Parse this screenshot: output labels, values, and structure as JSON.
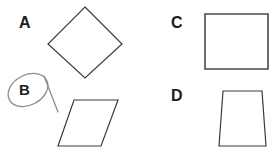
{
  "worksheet": {
    "background_color": "#ffffff",
    "stroke_color": "#3a3a3a",
    "annotation_color": "#8c8c8c",
    "label_color": "#1b1b1b",
    "width": 274,
    "height": 159
  },
  "options": [
    {
      "id": "a",
      "label": "A",
      "shape_name": "rhombus-diamond",
      "selected": false,
      "points": "85,7 122,44 85,78 48,44"
    },
    {
      "id": "b",
      "label": "B",
      "shape_name": "parallelogram",
      "selected": true,
      "points": "74,100 118,100 101,146 58,146"
    },
    {
      "id": "c",
      "label": "C",
      "shape_name": "rectangle",
      "selected": false,
      "points": "205,14 268,14 268,69 205,69"
    },
    {
      "id": "d",
      "label": "D",
      "shape_name": "trapezoid",
      "selected": false,
      "points": "223,91 262,91 266,146 219,146"
    }
  ],
  "annotation": {
    "name": "hand-drawn-circle-around-b",
    "target_option": "B",
    "ellipse": {
      "cx": 28,
      "cy": 90,
      "rx": 21,
      "ry": 15,
      "rotation": -28
    },
    "tail": "M 44,76 L 58,112"
  }
}
